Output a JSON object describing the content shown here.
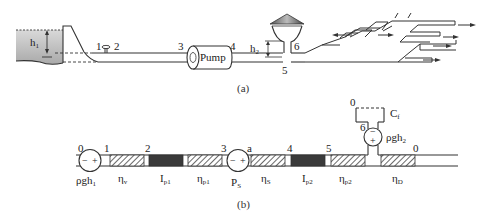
{
  "figure_a": {
    "caption": "(a)",
    "reservoir_label": "h",
    "reservoir_label_sub": "1",
    "node_labels": [
      "1",
      "2",
      "3",
      "4",
      "5",
      "6"
    ],
    "pump_label": "Pump",
    "tower_height_label": "h",
    "tower_height_label_sub": "2"
  },
  "figure_b": {
    "caption": "(b)",
    "node_labels": {
      "n0_left": "0",
      "n1": "1",
      "n2": "2",
      "n3": "3",
      "na": "a",
      "n4": "4",
      "n5": "5",
      "n6": "6",
      "n0_right": "0",
      "n0_top": "0"
    },
    "source_left": {
      "label": "ρgh",
      "sub": "1",
      "sign_minus": "−",
      "sign_plus": "+"
    },
    "source_pump": {
      "label": "P",
      "sub": "S",
      "sign_minus": "−",
      "sign_plus": "+"
    },
    "source_tower": {
      "label": "ρgh",
      "sub": "2",
      "sign_minus": "−",
      "sign_plus": "+"
    },
    "capacitor": {
      "label": "C",
      "sub": "f"
    },
    "elements": [
      {
        "type": "resistor",
        "label": "η",
        "sub": "v"
      },
      {
        "type": "inductor",
        "label": "I",
        "sub": "p1"
      },
      {
        "type": "resistor",
        "label": "η",
        "sub": "p1"
      },
      {
        "type": "resistor",
        "label": "η",
        "sub": "S"
      },
      {
        "type": "inductor",
        "label": "I",
        "sub": "p2"
      },
      {
        "type": "resistor",
        "label": "η",
        "sub": "p2"
      },
      {
        "type": "resistor",
        "label": "η",
        "sub": "D"
      }
    ]
  },
  "colors": {
    "line": "#333333",
    "water": "#cfcfcf",
    "inductor": "#3a3a3a",
    "background": "#ffffff"
  }
}
